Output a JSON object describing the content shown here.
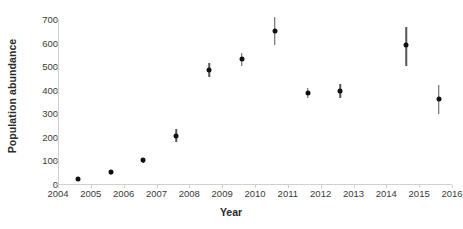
{
  "chart_data": {
    "type": "scatter",
    "title": "",
    "xlabel": "Year",
    "ylabel": "Population abundance",
    "xlim": [
      2004,
      2016
    ],
    "ylim": [
      0,
      700
    ],
    "grid": false,
    "legend": "none",
    "xticks": [
      "2004",
      "2005",
      "2006",
      "2007",
      "2008",
      "2009",
      "2010",
      "2011",
      "2012",
      "2013",
      "2014",
      "2015",
      "2016"
    ],
    "yticks": [
      "0",
      "100",
      "200",
      "300",
      "400",
      "500",
      "600",
      "700"
    ],
    "x": [
      2004.6,
      2005.6,
      2006.6,
      2007.6,
      2008.6,
      2009.6,
      2010.6,
      2011.6,
      2012.6,
      2014.6,
      2015.6
    ],
    "values": [
      20,
      50,
      100,
      205,
      485,
      530,
      650,
      385,
      395,
      590,
      360
    ],
    "err_low": [
      8,
      10,
      12,
      28,
      30,
      28,
      62,
      22,
      30,
      90,
      62
    ],
    "err_high": [
      8,
      10,
      12,
      30,
      30,
      26,
      60,
      22,
      30,
      75,
      58
    ],
    "point_color": "#111111",
    "error_color": "#555555",
    "axis_color": "#d0d0d0",
    "text_color": "#3a3a3a"
  }
}
